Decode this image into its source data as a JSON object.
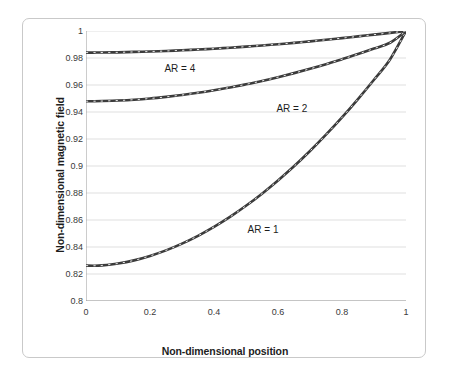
{
  "chart_data": {
    "type": "line",
    "title": "",
    "subtitle": "",
    "xlabel": "Non-dimensional position",
    "ylabel": "Non-dimensional magnetic field",
    "xlim": [
      0,
      1
    ],
    "ylim": [
      0.8,
      1
    ],
    "xticks": [
      "0",
      "0.2",
      "0.4",
      "0.6",
      "0.8",
      "1"
    ],
    "xtick_values": [
      0,
      0.2,
      0.4,
      0.6,
      0.8,
      1
    ],
    "yticks": [
      "0.8",
      "0.82",
      "0.84",
      "0.86",
      "0.88",
      "0.9",
      "0.92",
      "0.94",
      "0.96",
      "0.98",
      "1"
    ],
    "ytick_values": [
      0.8,
      0.82,
      0.84,
      0.86,
      0.88,
      0.9,
      0.92,
      0.94,
      0.96,
      0.98,
      1
    ],
    "grid": "horizontal",
    "legend_position": "inline-annotations",
    "line_style": "dashed",
    "line_color": "#3b3b3b",
    "series": [
      {
        "name": "AR = 1",
        "label": "AR = 1",
        "color": "#3b3b3b",
        "x": [
          0,
          0.025,
          0.05,
          0.1,
          0.15,
          0.2,
          0.25,
          0.3,
          0.35,
          0.4,
          0.45,
          0.5,
          0.55,
          0.6,
          0.65,
          0.7,
          0.75,
          0.8,
          0.85,
          0.9,
          0.95,
          1
        ],
        "values": [
          0.8262,
          0.8261,
          0.8264,
          0.8278,
          0.8301,
          0.8334,
          0.8375,
          0.8425,
          0.8483,
          0.8549,
          0.8623,
          0.8705,
          0.8795,
          0.8893,
          0.8998,
          0.9111,
          0.9232,
          0.936,
          0.9496,
          0.9639,
          0.9789,
          1.0
        ]
      },
      {
        "name": "AR = 2",
        "label": "AR = 2",
        "color": "#3b3b3b",
        "x": [
          0,
          0.025,
          0.05,
          0.1,
          0.15,
          0.2,
          0.25,
          0.3,
          0.35,
          0.4,
          0.45,
          0.5,
          0.55,
          0.6,
          0.65,
          0.7,
          0.75,
          0.8,
          0.85,
          0.9,
          0.95,
          1
        ],
        "values": [
          0.948,
          0.948,
          0.9481,
          0.9485,
          0.9491,
          0.95,
          0.9512,
          0.9526,
          0.9542,
          0.9561,
          0.9582,
          0.9605,
          0.963,
          0.9658,
          0.9688,
          0.972,
          0.9754,
          0.9791,
          0.9829,
          0.987,
          0.9913,
          1.0
        ]
      },
      {
        "name": "AR = 4",
        "label": "AR = 4",
        "color": "#3b3b3b",
        "x": [
          0,
          0.025,
          0.05,
          0.1,
          0.15,
          0.2,
          0.25,
          0.3,
          0.35,
          0.4,
          0.45,
          0.5,
          0.55,
          0.6,
          0.65,
          0.7,
          0.75,
          0.8,
          0.85,
          0.9,
          0.95,
          1
        ],
        "values": [
          0.984,
          0.984,
          0.9841,
          0.9842,
          0.9845,
          0.9848,
          0.9852,
          0.9857,
          0.9863,
          0.9869,
          0.9876,
          0.9884,
          0.9893,
          0.9902,
          0.9912,
          0.9923,
          0.9935,
          0.9947,
          0.996,
          0.9973,
          0.9986,
          1.0
        ]
      }
    ],
    "annotations": [
      {
        "text": "AR = 4",
        "x": 0.245,
        "y": 0.9715
      },
      {
        "text": "AR = 2",
        "x": 0.595,
        "y": 0.9425
      },
      {
        "text": "AR = 1",
        "x": 0.505,
        "y": 0.8525
      }
    ]
  },
  "axes": {
    "x_title": "Non-dimensional position",
    "y_title": "Non-dimensional magnetic field"
  }
}
